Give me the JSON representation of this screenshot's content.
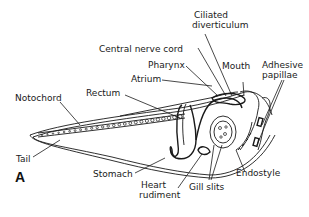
{
  "figure": {
    "panel_label": "A",
    "labels": {
      "ciliated_diverticulum_line1": "Ciliated",
      "ciliated_diverticulum_line2": "diverticulum",
      "central_nerve_cord": "Central nerve cord",
      "pharynx": "Pharynx",
      "atrium": "Atrium",
      "mouth": "Mouth",
      "adhesive_papillae_line1": "Adhesive",
      "adhesive_papillae_line2": "papillae",
      "notochord": "Notochord",
      "rectum": "Rectum",
      "tail": "Tail",
      "stomach": "Stomach",
      "heart_rudiment_line1": "Heart",
      "heart_rudiment_line2": "rudiment",
      "gill_slits": "Gill slits",
      "endostyle": "Endostyle"
    }
  }
}
